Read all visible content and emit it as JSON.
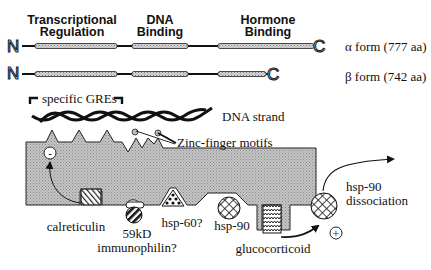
{
  "domains": {
    "transcriptional_line1": "Transcriptional",
    "transcriptional_line2": "Regulation",
    "dna_line1": "DNA",
    "dna_line2": "Binding",
    "hormone_line1": "Hormone",
    "hormone_line2": "Binding"
  },
  "forms": {
    "n_terminus": "N",
    "c_terminus": "C",
    "alpha": "α form (777 aa)",
    "beta": "β form (742 aa)"
  },
  "labels": {
    "specific_gres": "specific GREs",
    "dna_strand": "DNA strand",
    "zinc_finger": "Zinc-finger motifs",
    "minus_sign": "-",
    "plus_sign": "+",
    "calreticulin": "calreticulin",
    "immunophilin_line1": "59kD",
    "immunophilin_line2": "immunophilin?",
    "hsp60": "hsp-60?",
    "hsp90": "hsp-90",
    "glucocorticoid": "glucocorticoid",
    "dissociation_line1": "hsp-90",
    "dissociation_line2": "dissociation"
  },
  "colors": {
    "receptor_fill": "#b8b8b8",
    "domain_fill": "#c8c8c8",
    "line": "#111111"
  }
}
